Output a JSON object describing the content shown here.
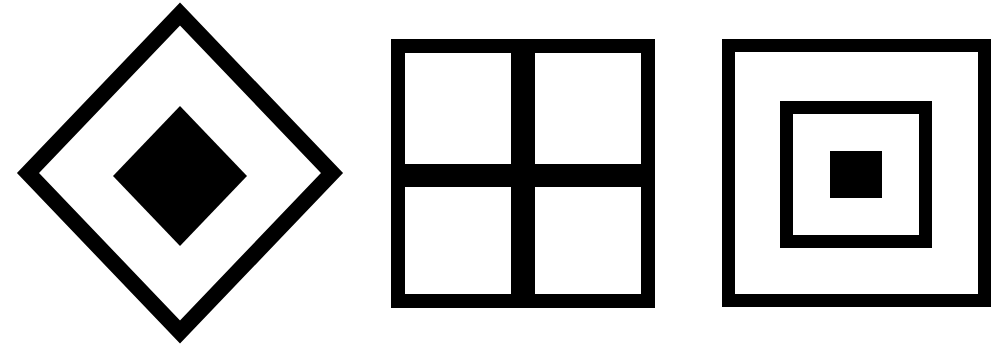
{
  "page": {
    "background_color": "#ffffff",
    "ink_color": "#000000",
    "width": 1008,
    "height": 345,
    "figure_count": 3
  },
  "figures": [
    {
      "id": "figure-1",
      "name": "nested-diamonds",
      "label": "Diamond within diamond",
      "shape": "diamond",
      "fill": "#000000",
      "outer": {
        "name": "outer-diamond-outline",
        "center_x": 180,
        "center_y": 173,
        "half_width": 152,
        "half_height": 159,
        "stroke_width": 16,
        "filled": false
      },
      "inner": {
        "name": "inner-diamond-solid",
        "center_x": 180,
        "center_y": 176,
        "half_width": 67,
        "half_height": 70,
        "filled": true
      }
    },
    {
      "id": "figure-2",
      "name": "quartered-square",
      "label": "Square divided into four panes",
      "shape": "square",
      "fill": "#000000",
      "frame": {
        "name": "square-outer-frame",
        "x": 391,
        "y": 39,
        "width": 264,
        "height": 269,
        "stroke_width": 14,
        "filled": false
      },
      "divider_vertical": {
        "name": "vertical-divider-bar",
        "x": 511,
        "y": 39,
        "width": 24,
        "height": 269
      },
      "divider_horizontal": {
        "name": "horizontal-divider-bar",
        "x": 391,
        "y": 164,
        "width": 264,
        "height": 23
      },
      "pane_count": 4
    },
    {
      "id": "figure-3",
      "name": "concentric-squares",
      "label": "Three concentric squares",
      "shape": "square",
      "fill": "#000000",
      "outer": {
        "name": "outer-square-outline",
        "x": 722,
        "y": 39,
        "width": 269,
        "height": 268,
        "stroke_width": 13,
        "filled": false
      },
      "middle": {
        "name": "middle-square-outline",
        "x": 780,
        "y": 101,
        "width": 152,
        "height": 147,
        "stroke_width": 13,
        "filled": false
      },
      "inner": {
        "name": "inner-square-solid",
        "x": 830,
        "y": 151,
        "width": 52,
        "height": 47,
        "filled": true
      }
    }
  ]
}
